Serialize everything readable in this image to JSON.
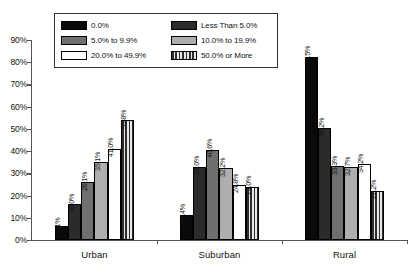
{
  "chart_data": {
    "type": "bar",
    "title": "",
    "xlabel": "",
    "ylabel": "",
    "ylim": [
      0,
      90
    ],
    "ytick_labels": [
      "90%",
      "80%",
      "70%",
      "60%",
      "50%",
      "40%",
      "30%",
      "20%",
      "10%",
      "0%"
    ],
    "ytick_values": [
      90,
      80,
      70,
      60,
      50,
      40,
      30,
      20,
      10,
      0
    ],
    "grid": false,
    "legend_position": "top-center",
    "categories": [
      "Urban",
      "Suburban",
      "Rural"
    ],
    "series": [
      {
        "name": "0.0%",
        "fill": "black",
        "values": [
          6.1,
          11.4,
          82.5
        ],
        "labels": [
          "6.1%",
          "11.4%",
          "82.5%"
        ]
      },
      {
        "name": "Less Than 5.0%",
        "fill": "dark-gray",
        "values": [
          16.0,
          33.0,
          50.2
        ],
        "labels": [
          "16.0%",
          "33.0%",
          "50.2%"
        ]
      },
      {
        "name": "5.0% to 9.9%",
        "fill": "medium-gray",
        "values": [
          26.1,
          40.6,
          33.3
        ],
        "labels": [
          "26.1%",
          "40.6%",
          "33.3%"
        ]
      },
      {
        "name": "10.0% to 19.9%",
        "fill": "light-gray",
        "values": [
          35.1,
          32.2,
          32.7
        ],
        "labels": [
          "35.1%",
          "32.2%",
          "32.7%"
        ]
      },
      {
        "name": "20.0% to 49.9%",
        "fill": "white",
        "values": [
          41.0,
          24.8,
          34.2
        ],
        "labels": [
          "41.0%",
          "24.8%",
          "34.2%"
        ]
      },
      {
        "name": "50.0% or More",
        "fill": "vertical-stripes",
        "values": [
          53.8,
          24.0,
          22.2
        ],
        "labels": [
          "53.8%",
          "24.0%",
          "22.2%"
        ]
      }
    ]
  },
  "legend": {
    "entries": [
      {
        "label": "0.0%",
        "fill": "black"
      },
      {
        "label": "Less Than 5.0%",
        "fill": "dark-gray"
      },
      {
        "label": "5.0% to 9.9%",
        "fill": "medium-gray"
      },
      {
        "label": "10.0% to 19.9%",
        "fill": "light-gray"
      },
      {
        "label": "20.0% to 49.9%",
        "fill": "white"
      },
      {
        "label": "50.0% or More",
        "fill": "vertical-stripes"
      }
    ]
  },
  "colors": {
    "black": "#0a0a0a",
    "dark_gray": "#2b2b2b",
    "medium_gray": "#6f6f6f",
    "light_gray": "#aeaeae",
    "white": "#ffffff",
    "axis": "#555555",
    "text": "#111111"
  }
}
